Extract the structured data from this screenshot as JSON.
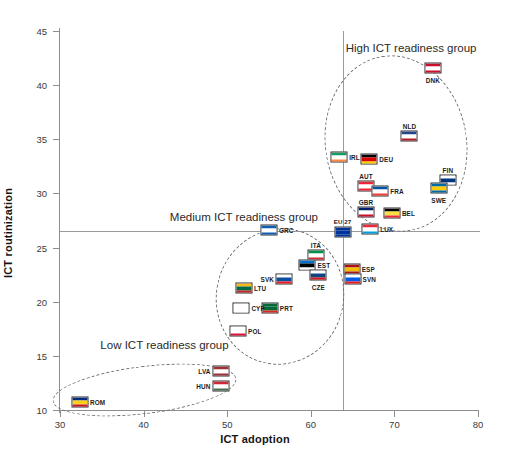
{
  "top_strip_text": "",
  "chart_data": {
    "type": "scatter",
    "title": "",
    "xlabel": "ICT adoption",
    "ylabel": "ICT routinization",
    "xlim": [
      30,
      80
    ],
    "ylim": [
      10,
      45
    ],
    "xticks": [
      30,
      40,
      50,
      60,
      70,
      80
    ],
    "yticks": [
      10,
      15,
      20,
      25,
      30,
      35,
      40,
      45
    ],
    "grid": false,
    "legend": "none",
    "reference_lines": {
      "vertical_x": 63.8,
      "horizontal_y": 26.5
    },
    "annotations": [
      {
        "label": "High ICT readiness group",
        "x": 72.0,
        "y": 43.4
      },
      {
        "label": "Medium ICT readiness group",
        "x": 52.0,
        "y": 27.8
      },
      {
        "label": "Low ICT readiness group",
        "x": 42.5,
        "y": 16.0
      }
    ],
    "point_label": "ISO country code",
    "points": [
      {
        "code": "DNK",
        "x": 74.6,
        "y": 41.6,
        "group": "High",
        "label_pos": "below",
        "flag": [
          "#c8102e",
          "#ffffff",
          "#c8102e"
        ]
      },
      {
        "code": "NLD",
        "x": 71.8,
        "y": 35.3,
        "group": "High",
        "label_pos": "above",
        "flag": [
          "#21468b",
          "#ffffff",
          "#ae1c28"
        ]
      },
      {
        "code": "IRL",
        "x": 63.4,
        "y": 33.4,
        "group": "High",
        "label_pos": "right",
        "flag": [
          "#169b62",
          "#ffffff",
          "#ff883e"
        ]
      },
      {
        "code": "DEU",
        "x": 67.0,
        "y": 33.2,
        "group": "High",
        "label_pos": "right",
        "flag": [
          "#000000",
          "#dd0000",
          "#ffce00"
        ]
      },
      {
        "code": "FIN",
        "x": 76.4,
        "y": 31.2,
        "group": "High",
        "label_pos": "above",
        "flag": [
          "#ffffff",
          "#003580",
          "#ffffff"
        ]
      },
      {
        "code": "AUT",
        "x": 66.6,
        "y": 30.7,
        "group": "High",
        "label_pos": "above",
        "flag": [
          "#ed2939",
          "#ffffff",
          "#ed2939"
        ]
      },
      {
        "code": "FRA",
        "x": 68.3,
        "y": 30.2,
        "group": "High",
        "label_pos": "right",
        "flag": [
          "#0055a4",
          "#ffffff",
          "#ef4135"
        ]
      },
      {
        "code": "SWE",
        "x": 75.3,
        "y": 30.5,
        "group": "High",
        "label_pos": "below",
        "flag": [
          "#006aa7",
          "#fecc00",
          "#006aa7"
        ]
      },
      {
        "code": "GBR",
        "x": 66.6,
        "y": 28.3,
        "group": "High",
        "label_pos": "above",
        "flag": [
          "#012169",
          "#ffffff",
          "#c8102e"
        ]
      },
      {
        "code": "BEL",
        "x": 69.7,
        "y": 28.2,
        "group": "High",
        "label_pos": "right",
        "flag": [
          "#000000",
          "#fae042",
          "#ed2939"
        ]
      },
      {
        "code": "LUX",
        "x": 67.1,
        "y": 26.7,
        "group": "High",
        "label_pos": "right",
        "flag": [
          "#ed2939",
          "#ffffff",
          "#00a1de"
        ]
      },
      {
        "code": "EU 27",
        "x": 63.8,
        "y": 26.4,
        "group": "Average",
        "label_pos": "eu",
        "flag": [
          "#003399",
          "#003399",
          "#003399"
        ]
      },
      {
        "code": "GRC",
        "x": 55.0,
        "y": 26.6,
        "group": "Medium",
        "label_pos": "right",
        "flag": [
          "#0d5eaf",
          "#ffffff",
          "#0d5eaf"
        ]
      },
      {
        "code": "ITA",
        "x": 60.6,
        "y": 24.3,
        "group": "Medium",
        "label_pos": "above",
        "flag": [
          "#009246",
          "#ffffff",
          "#ce2b37"
        ]
      },
      {
        "code": "EST",
        "x": 59.6,
        "y": 23.4,
        "group": "Medium",
        "label_pos": "right",
        "flag": [
          "#0072ce",
          "#000000",
          "#ffffff"
        ]
      },
      {
        "code": "ESP",
        "x": 64.9,
        "y": 23.0,
        "group": "Medium",
        "label_pos": "right",
        "flag": [
          "#aa151b",
          "#f1bf00",
          "#aa151b"
        ]
      },
      {
        "code": "CZE",
        "x": 60.9,
        "y": 22.5,
        "group": "Medium",
        "label_pos": "below",
        "flag": [
          "#ffffff",
          "#11457e",
          "#d7141a"
        ]
      },
      {
        "code": "SVK",
        "x": 56.8,
        "y": 22.1,
        "group": "Medium",
        "label_pos": "left",
        "flag": [
          "#ffffff",
          "#0b4ea2",
          "#ee1c25"
        ]
      },
      {
        "code": "SVN",
        "x": 65.0,
        "y": 22.1,
        "group": "Medium",
        "label_pos": "right",
        "flag": [
          "#ffffff",
          "#005ce6",
          "#ed1c24"
        ]
      },
      {
        "code": "LTU",
        "x": 52.0,
        "y": 21.3,
        "group": "Medium",
        "label_pos": "right",
        "flag": [
          "#fdb913",
          "#006a44",
          "#c1272d"
        ]
      },
      {
        "code": "PRT",
        "x": 55.1,
        "y": 19.4,
        "group": "Medium",
        "label_pos": "right",
        "flag": [
          "#046a38",
          "#046a38",
          "#da291c"
        ]
      },
      {
        "code": "CYP",
        "x": 51.7,
        "y": 19.4,
        "group": "Medium",
        "label_pos": "right",
        "flag": [
          "#ffffff",
          "#ffffff",
          "#ffffff"
        ]
      },
      {
        "code": "POL",
        "x": 51.3,
        "y": 17.3,
        "group": "Medium",
        "label_pos": "right",
        "flag": [
          "#ffffff",
          "#ffffff",
          "#dc143c"
        ]
      },
      {
        "code": "LVA",
        "x": 49.2,
        "y": 13.6,
        "group": "Low",
        "label_pos": "left",
        "flag": [
          "#9e3039",
          "#ffffff",
          "#9e3039"
        ]
      },
      {
        "code": "HUN",
        "x": 49.2,
        "y": 12.2,
        "group": "Low",
        "label_pos": "left",
        "flag": [
          "#ce2939",
          "#ffffff",
          "#477050"
        ]
      },
      {
        "code": "ROM",
        "x": 32.4,
        "y": 10.7,
        "group": "Low",
        "label_pos": "right",
        "flag": [
          "#002b7f",
          "#fcd116",
          "#ce1126"
        ]
      }
    ]
  },
  "colors": {
    "axis": "#8e8e92",
    "reference_line": "#9a9a9e",
    "ellipse": "#6d6d72",
    "text": "#1a1a1a"
  }
}
